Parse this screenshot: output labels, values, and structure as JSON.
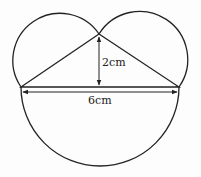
{
  "diagram": {
    "labels": {
      "height": "2cm",
      "base": "6cm"
    },
    "colors": {
      "stroke": "#222222",
      "background": "#fdfdfd"
    },
    "shapes": {
      "triangle": [
        "A (left)",
        "B (right)",
        "C (apex)"
      ],
      "semicircles": [
        "on left side AC",
        "on right side BC",
        "on base AB"
      ]
    }
  }
}
